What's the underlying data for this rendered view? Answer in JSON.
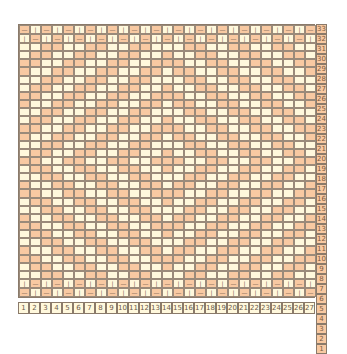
{
  "colors": {
    "orange": "#f8c9a2",
    "cream": "#fff8dc"
  },
  "columns": 27,
  "rows": 33,
  "row_labels": [
    "33",
    "32",
    "31",
    "30",
    "29",
    "28",
    "27",
    "26",
    "25",
    "24",
    "23",
    "22",
    "21",
    "20",
    "19",
    "18",
    "17",
    "16",
    "15",
    "14",
    "13",
    "12",
    "11",
    "10",
    "9",
    "8",
    "7",
    "6",
    "5",
    "4",
    "3",
    "2",
    "1"
  ],
  "col_labels": [
    "1",
    "2",
    "3",
    "4",
    "5",
    "6",
    "7",
    "8",
    "9",
    "10",
    "11",
    "12",
    "13",
    "14",
    "15",
    "16",
    "17",
    "18",
    "19",
    "20",
    "21",
    "22",
    "23",
    "24",
    "25",
    "26",
    "27"
  ],
  "border_symbols": {
    "orange": "—",
    "cream": "|"
  }
}
